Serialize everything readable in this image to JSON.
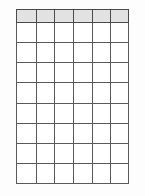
{
  "document": {
    "type": "blank-table-grid",
    "background_color": "#fdfdfd"
  },
  "table": {
    "name": "blank-grid",
    "columns": 6,
    "header_rows": 1,
    "body_rows": 8,
    "total_rows": 9,
    "border_color": "#5a5a5a",
    "header_fill_color": "#e2e2e2",
    "cell_fill_color": "#ffffff",
    "column_headers": [
      "",
      "",
      "",
      "",
      "",
      ""
    ],
    "rows": [
      [
        "",
        "",
        "",
        "",
        "",
        ""
      ],
      [
        "",
        "",
        "",
        "",
        "",
        ""
      ],
      [
        "",
        "",
        "",
        "",
        "",
        ""
      ],
      [
        "",
        "",
        "",
        "",
        "",
        ""
      ],
      [
        "",
        "",
        "",
        "",
        "",
        ""
      ],
      [
        "",
        "",
        "",
        "",
        "",
        ""
      ],
      [
        "",
        "",
        "",
        "",
        "",
        ""
      ],
      [
        "",
        "",
        "",
        "",
        "",
        ""
      ]
    ]
  }
}
